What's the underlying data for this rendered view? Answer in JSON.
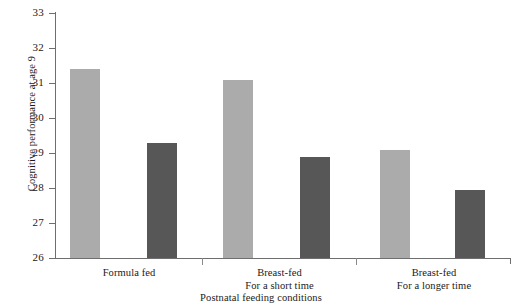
{
  "chart_data": {
    "type": "bar",
    "title": "",
    "subtitle": "",
    "xlabel": "Postnatal feeding conditions",
    "ylabel": "Cognitive performance at age 9",
    "categories": [
      "Formula fed",
      "Breast-fed\nFor a short time",
      "Breast-fed\nFor a longer time"
    ],
    "category_lines": [
      [
        "Formula fed"
      ],
      [
        "Breast-fed",
        "For a short time"
      ],
      [
        "Breast-fed",
        "For a longer time"
      ]
    ],
    "series": [
      {
        "name": "light-gray-series",
        "color": "#ababab",
        "values": [
          31.4,
          31.1,
          29.1
        ]
      },
      {
        "name": "dark-gray-series",
        "color": "#575757",
        "values": [
          29.3,
          28.9,
          27.95
        ]
      }
    ],
    "ylim": [
      26,
      33
    ],
    "yticks": [
      26,
      27,
      28,
      29,
      30,
      31,
      32,
      33
    ],
    "ytick_labels": [
      "26",
      "27",
      "28",
      "29",
      "30",
      "31",
      "32",
      "33"
    ],
    "grid": false,
    "legend": "none",
    "axis_color": "#6e6e6e"
  },
  "axis": {
    "y_title": "Cognitive performance at age 9",
    "x_title": "Postnatal feeding conditions"
  },
  "ytick_labels": [
    "33",
    "32",
    "31",
    "30",
    "29",
    "28",
    "27",
    "26"
  ],
  "groups": [
    {
      "line1": "Formula fed",
      "line2": ""
    },
    {
      "line1": "Breast-fed",
      "line2": "For a short time"
    },
    {
      "line1": "Breast-fed",
      "line2": "For a longer time"
    }
  ]
}
